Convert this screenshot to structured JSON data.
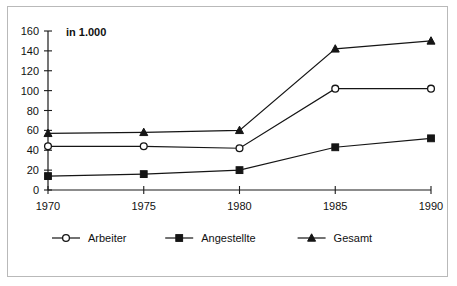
{
  "chart_data": {
    "type": "line",
    "title": "",
    "subtitle": "",
    "unit_note": "in 1.000",
    "xlabel": "",
    "ylabel": "",
    "categories": [
      "1970",
      "1975",
      "1980",
      "1985",
      "1990"
    ],
    "x": [
      1970,
      1975,
      1980,
      1985,
      1990
    ],
    "xlim": [
      1970,
      1990
    ],
    "ylim": [
      0,
      160
    ],
    "y_ticks": [
      0,
      20,
      40,
      60,
      80,
      100,
      120,
      140,
      160
    ],
    "y_tick_labels": [
      "0",
      "20",
      "40",
      "60",
      "80",
      "100",
      "120",
      "140",
      "160"
    ],
    "grid": false,
    "legend_position": "bottom-left",
    "series": [
      {
        "name": "Arbeiter",
        "marker": "open-circle",
        "values": [
          44,
          44,
          42,
          102,
          102
        ]
      },
      {
        "name": "Angestellte",
        "marker": "filled-square",
        "values": [
          14,
          16,
          20,
          43,
          52
        ]
      },
      {
        "name": "Gesamt",
        "marker": "filled-triangle",
        "values": [
          57,
          58,
          60,
          142,
          150
        ]
      }
    ]
  },
  "legend": {
    "items": [
      {
        "label": "Arbeiter",
        "marker": "open-circle"
      },
      {
        "label": "Angestellte",
        "marker": "filled-square"
      },
      {
        "label": "Gesamt",
        "marker": "filled-triangle"
      }
    ]
  },
  "colors": {
    "ink": "#151515",
    "frame": "#b9b9b9",
    "background": "#ffffff"
  }
}
